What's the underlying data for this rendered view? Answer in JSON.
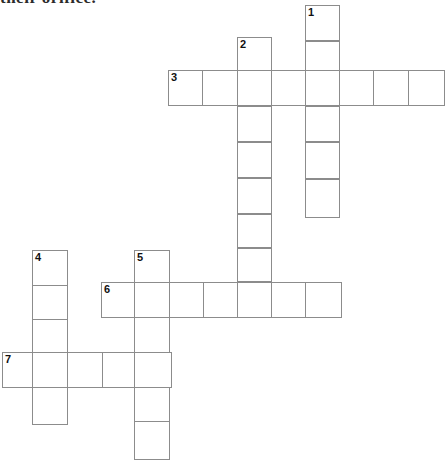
{
  "page": {
    "width": 447,
    "height": 468,
    "background_color": "#ffffff",
    "top_text_fragment": "their orifice."
  },
  "grid": {
    "cell_width": 34,
    "cell_height": 35,
    "cell_border_color": "#8c8c8c",
    "cell_fill_color": "#ffffff",
    "number_color": "#111111",
    "entries": [
      {
        "number": "1",
        "direction": "down",
        "length": 6,
        "start_x": 305,
        "start_y": 5
      },
      {
        "number": "2",
        "direction": "down",
        "length": 8,
        "start_x": 237,
        "start_y": 37
      },
      {
        "number": "3",
        "direction": "across",
        "length": 8,
        "start_x": 168,
        "start_y": 70
      },
      {
        "number": "4",
        "direction": "down",
        "length": 5,
        "start_x": 32,
        "start_y": 250
      },
      {
        "number": "5",
        "direction": "down",
        "length": 6,
        "start_x": 134,
        "start_y": 250
      },
      {
        "number": "6",
        "direction": "across",
        "length": 7,
        "start_x": 101,
        "start_y": 282
      },
      {
        "number": "7",
        "direction": "across",
        "length": 5,
        "start_x": 2,
        "start_y": 352
      }
    ],
    "cells": [
      {
        "name": "cell-1-down-0",
        "x": 305,
        "y": 5,
        "w": 35,
        "h": 36,
        "number": "1"
      },
      {
        "name": "cell-1-down-1",
        "x": 305,
        "y": 41,
        "w": 35,
        "h": 36,
        "number": ""
      },
      {
        "name": "cell-1-down-2",
        "x": 305,
        "y": 70,
        "w": 35,
        "h": 36,
        "number": ""
      },
      {
        "name": "cell-1-down-3",
        "x": 305,
        "y": 106,
        "w": 35,
        "h": 36,
        "number": ""
      },
      {
        "name": "cell-1-down-4",
        "x": 305,
        "y": 142,
        "w": 35,
        "h": 37,
        "number": ""
      },
      {
        "name": "cell-1-down-5",
        "x": 305,
        "y": 179,
        "w": 35,
        "h": 39,
        "number": ""
      },
      {
        "name": "cell-2-down-0",
        "x": 237,
        "y": 37,
        "w": 35,
        "h": 34,
        "number": "2"
      },
      {
        "name": "cell-2-down-1",
        "x": 237,
        "y": 70,
        "w": 35,
        "h": 36,
        "number": ""
      },
      {
        "name": "cell-2-down-2",
        "x": 237,
        "y": 106,
        "w": 35,
        "h": 36,
        "number": ""
      },
      {
        "name": "cell-2-down-3",
        "x": 237,
        "y": 142,
        "w": 35,
        "h": 36,
        "number": ""
      },
      {
        "name": "cell-2-down-4",
        "x": 237,
        "y": 178,
        "w": 35,
        "h": 36,
        "number": ""
      },
      {
        "name": "cell-2-down-5",
        "x": 237,
        "y": 214,
        "w": 35,
        "h": 34,
        "number": ""
      },
      {
        "name": "cell-2-down-6",
        "x": 237,
        "y": 248,
        "w": 35,
        "h": 34,
        "number": ""
      },
      {
        "name": "cell-2-down-7",
        "x": 237,
        "y": 282,
        "w": 35,
        "h": 36,
        "number": ""
      },
      {
        "name": "cell-3-across-0",
        "x": 168,
        "y": 70,
        "w": 35,
        "h": 36,
        "number": "3"
      },
      {
        "name": "cell-3-across-1",
        "x": 202,
        "y": 70,
        "w": 36,
        "h": 36,
        "number": ""
      },
      {
        "name": "cell-3-across-2",
        "x": 237,
        "y": 70,
        "w": 35,
        "h": 36,
        "number": ""
      },
      {
        "name": "cell-3-across-3",
        "x": 271,
        "y": 70,
        "w": 35,
        "h": 36,
        "number": ""
      },
      {
        "name": "cell-3-across-4",
        "x": 305,
        "y": 70,
        "w": 35,
        "h": 36,
        "number": ""
      },
      {
        "name": "cell-3-across-5",
        "x": 339,
        "y": 70,
        "w": 35,
        "h": 36,
        "number": ""
      },
      {
        "name": "cell-3-across-6",
        "x": 373,
        "y": 70,
        "w": 36,
        "h": 36,
        "number": ""
      },
      {
        "name": "cell-3-across-7",
        "x": 408,
        "y": 70,
        "w": 37,
        "h": 36,
        "number": ""
      },
      {
        "name": "cell-4-down-0",
        "x": 32,
        "y": 250,
        "w": 36,
        "h": 36,
        "number": "4"
      },
      {
        "name": "cell-4-down-1",
        "x": 32,
        "y": 285,
        "w": 36,
        "h": 35,
        "number": ""
      },
      {
        "name": "cell-4-down-2",
        "x": 32,
        "y": 319,
        "w": 36,
        "h": 34,
        "number": ""
      },
      {
        "name": "cell-4-down-3",
        "x": 32,
        "y": 352,
        "w": 36,
        "h": 36,
        "number": ""
      },
      {
        "name": "cell-4-down-4",
        "x": 32,
        "y": 387,
        "w": 36,
        "h": 38,
        "number": ""
      },
      {
        "name": "cell-5-down-0",
        "x": 134,
        "y": 250,
        "w": 36,
        "h": 36,
        "number": "5"
      },
      {
        "name": "cell-5-down-1",
        "x": 134,
        "y": 282,
        "w": 36,
        "h": 36,
        "number": ""
      },
      {
        "name": "cell-5-down-2",
        "x": 134,
        "y": 317,
        "w": 36,
        "h": 36,
        "number": ""
      },
      {
        "name": "cell-5-down-3",
        "x": 134,
        "y": 352,
        "w": 36,
        "h": 36,
        "number": ""
      },
      {
        "name": "cell-5-down-4",
        "x": 134,
        "y": 387,
        "w": 36,
        "h": 35,
        "number": ""
      },
      {
        "name": "cell-5-down-5",
        "x": 134,
        "y": 421,
        "w": 36,
        "h": 39,
        "number": ""
      },
      {
        "name": "cell-6-across-0",
        "x": 101,
        "y": 282,
        "w": 35,
        "h": 36,
        "number": "6"
      },
      {
        "name": "cell-6-across-1",
        "x": 134,
        "y": 282,
        "w": 36,
        "h": 36,
        "number": ""
      },
      {
        "name": "cell-6-across-2",
        "x": 169,
        "y": 282,
        "w": 35,
        "h": 36,
        "number": ""
      },
      {
        "name": "cell-6-across-3",
        "x": 203,
        "y": 282,
        "w": 35,
        "h": 36,
        "number": ""
      },
      {
        "name": "cell-6-across-4",
        "x": 237,
        "y": 282,
        "w": 35,
        "h": 36,
        "number": ""
      },
      {
        "name": "cell-6-across-5",
        "x": 271,
        "y": 282,
        "w": 35,
        "h": 36,
        "number": ""
      },
      {
        "name": "cell-6-across-6",
        "x": 305,
        "y": 282,
        "w": 37,
        "h": 36,
        "number": ""
      },
      {
        "name": "cell-7-across-0",
        "x": 2,
        "y": 352,
        "w": 31,
        "h": 36,
        "number": "7"
      },
      {
        "name": "cell-7-across-1",
        "x": 32,
        "y": 352,
        "w": 36,
        "h": 36,
        "number": ""
      },
      {
        "name": "cell-7-across-2",
        "x": 67,
        "y": 352,
        "w": 36,
        "h": 36,
        "number": ""
      },
      {
        "name": "cell-7-across-3",
        "x": 102,
        "y": 352,
        "w": 33,
        "h": 36,
        "number": ""
      },
      {
        "name": "cell-7-across-4",
        "x": 134,
        "y": 352,
        "w": 38,
        "h": 36,
        "number": ""
      }
    ]
  }
}
